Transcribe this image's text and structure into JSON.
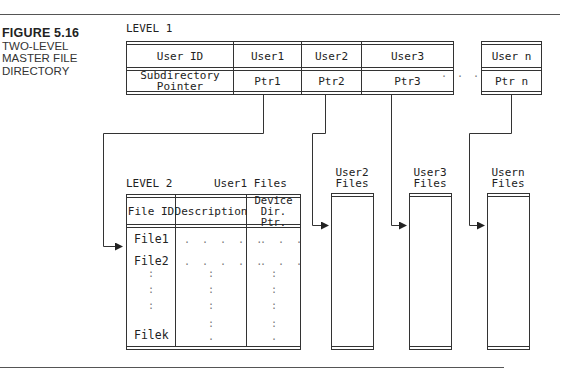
{
  "figure": {
    "number": "FIGURE 5.16",
    "title_lines": [
      "TWO-LEVEL",
      "MASTER FILE",
      "DIRECTORY"
    ]
  },
  "level1": {
    "label": "LEVEL 1",
    "header_row": [
      "User ID",
      "User1",
      "User2",
      "User3",
      "User n"
    ],
    "pointer_row": [
      "Subdirectory Pointer",
      "Ptr1",
      "Ptr2",
      "Ptr3",
      "Ptr n"
    ],
    "pointer_row_label_lines": [
      "Subdirectory",
      "Pointer"
    ],
    "ellipsis": ". . ."
  },
  "level2": {
    "label": "LEVEL 2",
    "table_title": "User1 Files",
    "columns": [
      "File ID",
      "Description",
      "Device Dir. Ptr."
    ],
    "device_col_lines": [
      "Device",
      "Dir. Ptr."
    ],
    "rows": [
      {
        "file_id": "File1",
        "description": ". . . . .",
        "device": ". . ."
      },
      {
        "file_id": "File2",
        "description": ". . . . .",
        "device": ". . ."
      },
      {
        "file_id": "Filek",
        "description": ".",
        "device": "."
      }
    ],
    "vertical_ellipsis": ":"
  },
  "subdirectories": [
    {
      "title_lines": [
        "User2",
        "Files"
      ]
    },
    {
      "title_lines": [
        "User3",
        "Files"
      ]
    },
    {
      "title_lines": [
        "Usern",
        "Files"
      ]
    }
  ]
}
